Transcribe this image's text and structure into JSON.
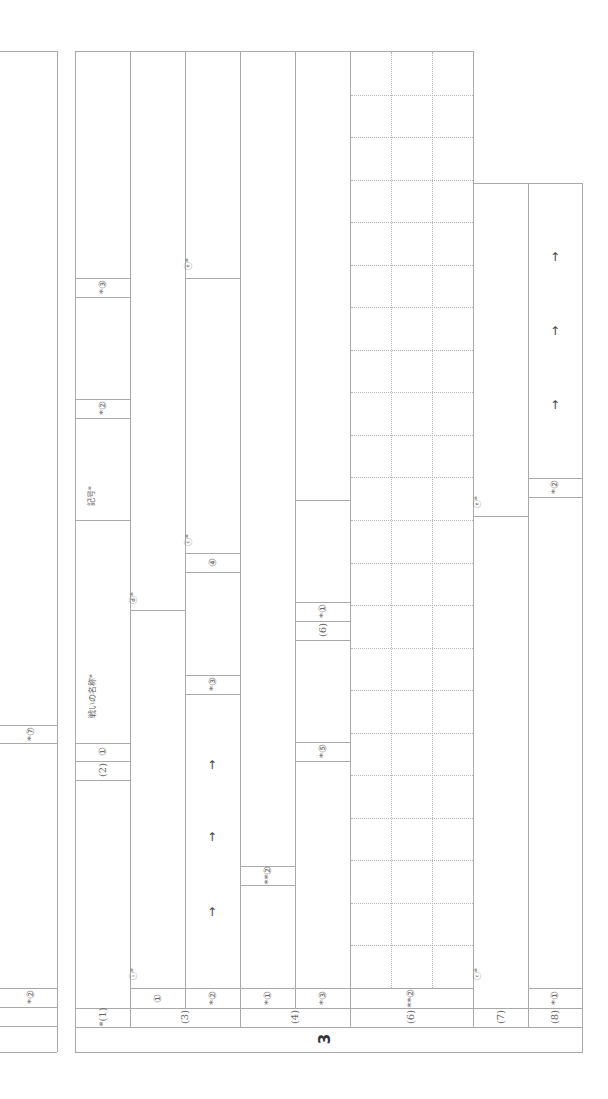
{
  "sheet": {
    "orientation": "rotated-90",
    "section_number": "3",
    "left_panel": {
      "cells": [
        {
          "id": "left-7",
          "label": "*⑦"
        },
        {
          "id": "left-2",
          "label": "*②"
        }
      ]
    },
    "columns": [
      {
        "id": "q1",
        "label": "*(1)",
        "cells": [
          {
            "label": "(2) ①"
          },
          {
            "label": "②",
            "sub": "*②"
          },
          {
            "label": "*②"
          },
          {
            "label": "*③"
          },
          {
            "label": "戦いの名称*"
          },
          {
            "label": "記号*"
          }
        ]
      },
      {
        "id": "q3",
        "label": "(3)",
        "cells": [
          {
            "label": "①"
          },
          {
            "label": "ⓘ*"
          },
          {
            "label": "ⓓ*"
          }
        ]
      },
      {
        "id": "q3b",
        "label": "",
        "cells": [
          {
            "label": "*②"
          },
          {
            "label": "*③"
          },
          {
            "label": "④"
          },
          {
            "label": "ⓒ*"
          },
          {
            "label": "ⓔ*"
          }
        ],
        "arrows": [
          "→",
          "→",
          "→"
        ]
      },
      {
        "id": "q4",
        "label": "(4)",
        "cells": [
          {
            "label": "*①"
          },
          {
            "label": "**②"
          }
        ]
      },
      {
        "id": "q4b",
        "label": "",
        "cells": [
          {
            "label": "*③"
          },
          {
            "label": "*⑤"
          },
          {
            "label": "(6)"
          },
          {
            "label": "*①"
          }
        ]
      },
      {
        "id": "q6",
        "label": "(6)",
        "cells": [
          {
            "label": "**②"
          }
        ],
        "grid": {
          "cols": 3,
          "rows": 22
        }
      },
      {
        "id": "q7",
        "label": "(7)",
        "cells": [
          {
            "label": "ⓒ*"
          },
          {
            "label": "ⓔ*"
          }
        ]
      },
      {
        "id": "q8",
        "label": "(8)",
        "cells": [
          {
            "label": "*①"
          },
          {
            "label": "*②"
          }
        ],
        "arrows": [
          "→",
          "→",
          "→"
        ]
      }
    ]
  }
}
